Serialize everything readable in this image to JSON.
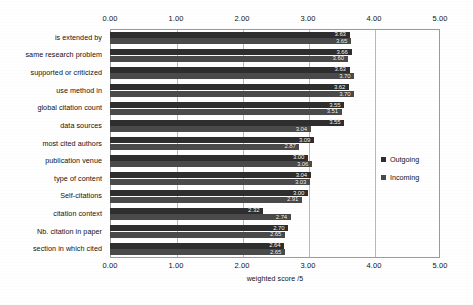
{
  "chart_data": {
    "type": "bar",
    "orientation": "horizontal",
    "title": "",
    "xlabel": "weighted score /5",
    "ylabel": "",
    "xlim": [
      0,
      5
    ],
    "xticks": [
      "0.00",
      "1.00",
      "2.00",
      "3.00",
      "4.00",
      "5.00"
    ],
    "xtick_values": [
      0,
      1,
      2,
      3,
      4,
      5
    ],
    "grid": true,
    "axis_top": true,
    "axis_bottom": true,
    "legend_position": "right",
    "categories": [
      "is extended by",
      "same research problem",
      "supported or criticized",
      "use method in",
      "global citation count",
      "data sources",
      "most cited authors",
      "publication venue",
      "type of content",
      "Self-citations",
      "citation context",
      "Nb. citation in paper",
      "section in which cited"
    ],
    "series": [
      {
        "name": "Outgoing",
        "color": "#2e2e2e",
        "values": [
          3.63,
          3.66,
          3.63,
          3.62,
          3.55,
          3.55,
          3.09,
          3.0,
          3.04,
          3.0,
          2.32,
          2.7,
          2.64
        ]
      },
      {
        "name": "Incoming",
        "color": "#4a4a4a",
        "values": [
          3.65,
          3.6,
          3.7,
          3.7,
          3.51,
          3.04,
          2.87,
          3.06,
          3.03,
          2.91,
          2.74,
          2.65,
          2.65
        ]
      }
    ]
  },
  "legend": {
    "items": [
      {
        "label": "Outgoing",
        "color": "#2e2e2e"
      },
      {
        "label": "Incoming",
        "color": "#4a4a4a"
      }
    ]
  }
}
